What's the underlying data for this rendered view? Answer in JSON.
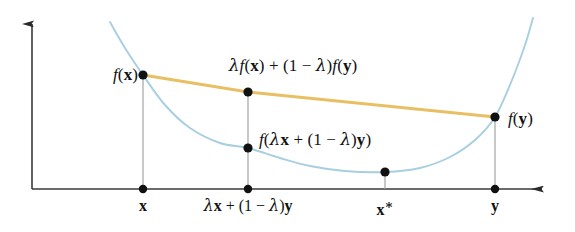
{
  "figure": {
    "background_color": "#ffffff",
    "curve_color": "#a8cfe0",
    "chord_color": "#e8c063",
    "axis_color": "#3a3a3a",
    "drop_line_color": "#9a9a9a",
    "point_color": "#111111",
    "text_color": "#111111"
  },
  "labels": {
    "f_x": "f(x)",
    "chord_midpoint": "λf(x) + (1 − λ)f(y)",
    "curve_midpoint": "f(λx + (1 − λ)y)",
    "f_y": "f(y)"
  },
  "axis_ticks": {
    "x": "x",
    "combo": "λx + (1 − λ)y",
    "x_star": "x*",
    "y": "y"
  },
  "chart_data": {
    "type": "line",
    "xlabel": "",
    "ylabel": "",
    "grid": false,
    "legend": false,
    "xlim": [
      0,
      575
    ],
    "ylim": [
      232,
      0
    ],
    "axes": {
      "origin": [
        32,
        189
      ],
      "y_axis_top": [
        32,
        20
      ],
      "x_axis_right": [
        550,
        189
      ],
      "arrowheads": [
        "y-axis-top",
        "x-axis-right"
      ]
    },
    "series": [
      {
        "name": "convex-curve",
        "color": "#a8cfe0",
        "points": [
          [
            110,
            22
          ],
          [
            125,
            48
          ],
          [
            143,
            75
          ],
          [
            165,
            105
          ],
          [
            190,
            128
          ],
          [
            220,
            143
          ],
          [
            248,
            148
          ],
          [
            280,
            158
          ],
          [
            310,
            166
          ],
          [
            345,
            171
          ],
          [
            385,
            172
          ],
          [
            420,
            168
          ],
          [
            450,
            157
          ],
          [
            475,
            140
          ],
          [
            495,
            117
          ],
          [
            512,
            80
          ],
          [
            525,
            45
          ],
          [
            533,
            18
          ]
        ]
      },
      {
        "name": "chord",
        "color": "#e8c063",
        "points": [
          [
            143,
            75
          ],
          [
            248,
            92
          ],
          [
            495,
            117
          ]
        ]
      }
    ],
    "marked_points": [
      {
        "name": "f(x)",
        "x": 143,
        "y": 75,
        "on": "curve-and-chord"
      },
      {
        "name": "chord-midpoint",
        "x": 248,
        "y": 92,
        "on": "chord"
      },
      {
        "name": "curve-midpoint",
        "x": 248,
        "y": 148,
        "on": "curve"
      },
      {
        "name": "f(y)",
        "x": 495,
        "y": 117,
        "on": "curve-and-chord"
      },
      {
        "name": "minimum",
        "x": 385,
        "y": 172,
        "on": "curve"
      },
      {
        "name": "tick-x",
        "x": 143,
        "y": 189,
        "on": "x-axis"
      },
      {
        "name": "tick-combo",
        "x": 248,
        "y": 189,
        "on": "x-axis"
      },
      {
        "name": "tick-y",
        "x": 495,
        "y": 189,
        "on": "x-axis"
      }
    ],
    "drop_lines": [
      {
        "name": "x-drop",
        "x": 143,
        "y_from": 75,
        "y_to": 189
      },
      {
        "name": "combo-drop",
        "x": 248,
        "y_from": 92,
        "y_to": 189
      },
      {
        "name": "x-star-drop",
        "x": 385,
        "y_from": 172,
        "y_to": 189
      },
      {
        "name": "y-drop",
        "x": 495,
        "y_from": 117,
        "y_to": 189
      }
    ]
  }
}
